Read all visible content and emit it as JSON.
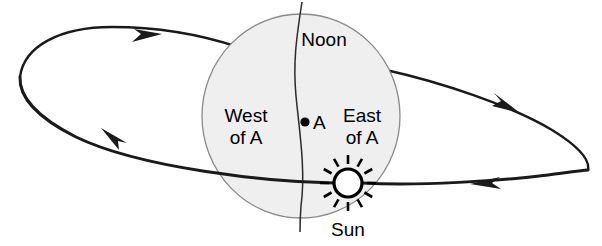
{
  "diagram": {
    "background_color": "#ffffff",
    "width": 602,
    "height": 246
  },
  "globe": {
    "name": "earth-globe",
    "fill_color": "#efefef",
    "stroke_color": "#8a8a8a",
    "center_x": 301,
    "center_y": 116,
    "radius_x": 99,
    "radius_y": 102
  },
  "labels": {
    "noon": "Noon",
    "west_line1": "West",
    "west_line2": "of A",
    "east_line1": "East",
    "east_line2": "of A",
    "point_a": "A",
    "sun": "Sun"
  },
  "sun": {
    "name": "sun-symbol",
    "center_x": 348,
    "center_y": 183,
    "radius": 14,
    "ray_count": 12,
    "body_color": "#ffffff",
    "outline_color": "#000000"
  },
  "point_a": {
    "name": "point-a-marker",
    "x": 305,
    "y": 122,
    "color": "#000000"
  },
  "orbit": {
    "name": "orbit-ellipse",
    "stroke_color": "#1a1a1a",
    "direction": "clockwise-in-projection",
    "arrow_count": 4,
    "arrows": [
      {
        "name": "orbit-arrow-top-left",
        "x": 148,
        "y": 39,
        "direction": "right"
      },
      {
        "name": "orbit-arrow-right",
        "x": 508,
        "y": 104,
        "direction": "down-right"
      },
      {
        "name": "orbit-arrow-bottom-right",
        "x": 487,
        "y": 185,
        "direction": "left"
      },
      {
        "name": "orbit-arrow-left",
        "x": 116,
        "y": 134,
        "direction": "down-left"
      }
    ]
  },
  "meridian": {
    "name": "noon-meridian-line",
    "stroke_color": "#2b2b2b",
    "top_x": 302,
    "top_y": 2,
    "bottom_x": 300,
    "bottom_y": 232
  }
}
